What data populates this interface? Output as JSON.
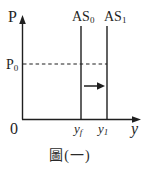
{
  "figure": {
    "caption": "圖(一)",
    "colors": {
      "ink": "#1f1f1f",
      "background": "#ffffff"
    },
    "axes": {
      "p_axis_label": "P",
      "x_axis_label": "y",
      "origin_label": "0"
    },
    "price_line": {
      "label_base": "P",
      "label_sub": "0",
      "style": "dashed"
    },
    "curves": [
      {
        "name": "AS0",
        "label_base": "AS",
        "label_sub": "0"
      },
      {
        "name": "AS1",
        "label_base": "AS",
        "label_sub": "1"
      }
    ],
    "x_ticks": [
      {
        "label_base": "y",
        "label_sub": "f"
      },
      {
        "label_base": "y",
        "label_sub": "1"
      }
    ],
    "shift_arrow": {
      "direction": "right"
    }
  }
}
